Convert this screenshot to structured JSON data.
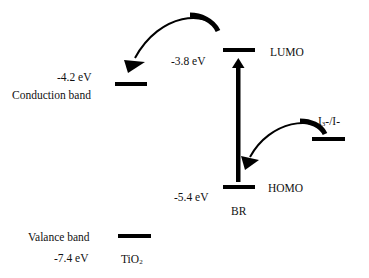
{
  "diagram": {
    "title": "",
    "levels": {
      "tio2_conduction": {
        "energy": "-4.2 eV",
        "label": "Conduction band"
      },
      "tio2_valence": {
        "energy": "-7.4 eV",
        "label": "Valance band",
        "material": "TiO",
        "material_sub": "2"
      },
      "br_lumo": {
        "energy": "-3.8 eV",
        "label": "LUMO"
      },
      "br_homo": {
        "energy": "-5.4 eV",
        "label": "HOMO",
        "material": "BR"
      },
      "redox": {
        "label_main": "I",
        "label_sub": "3",
        "label_rest": "-/I-"
      }
    },
    "arrows": [
      {
        "from": "LUMO",
        "to": "Conduction band",
        "meaning": "electron injection"
      },
      {
        "from": "HOMO",
        "to": "LUMO",
        "meaning": "excitation"
      },
      {
        "from": "I3-/I-",
        "to": "HOMO",
        "meaning": "dye regeneration"
      }
    ],
    "colors": {
      "line": "#000000",
      "text": "#111111",
      "background": "#ffffff"
    }
  }
}
